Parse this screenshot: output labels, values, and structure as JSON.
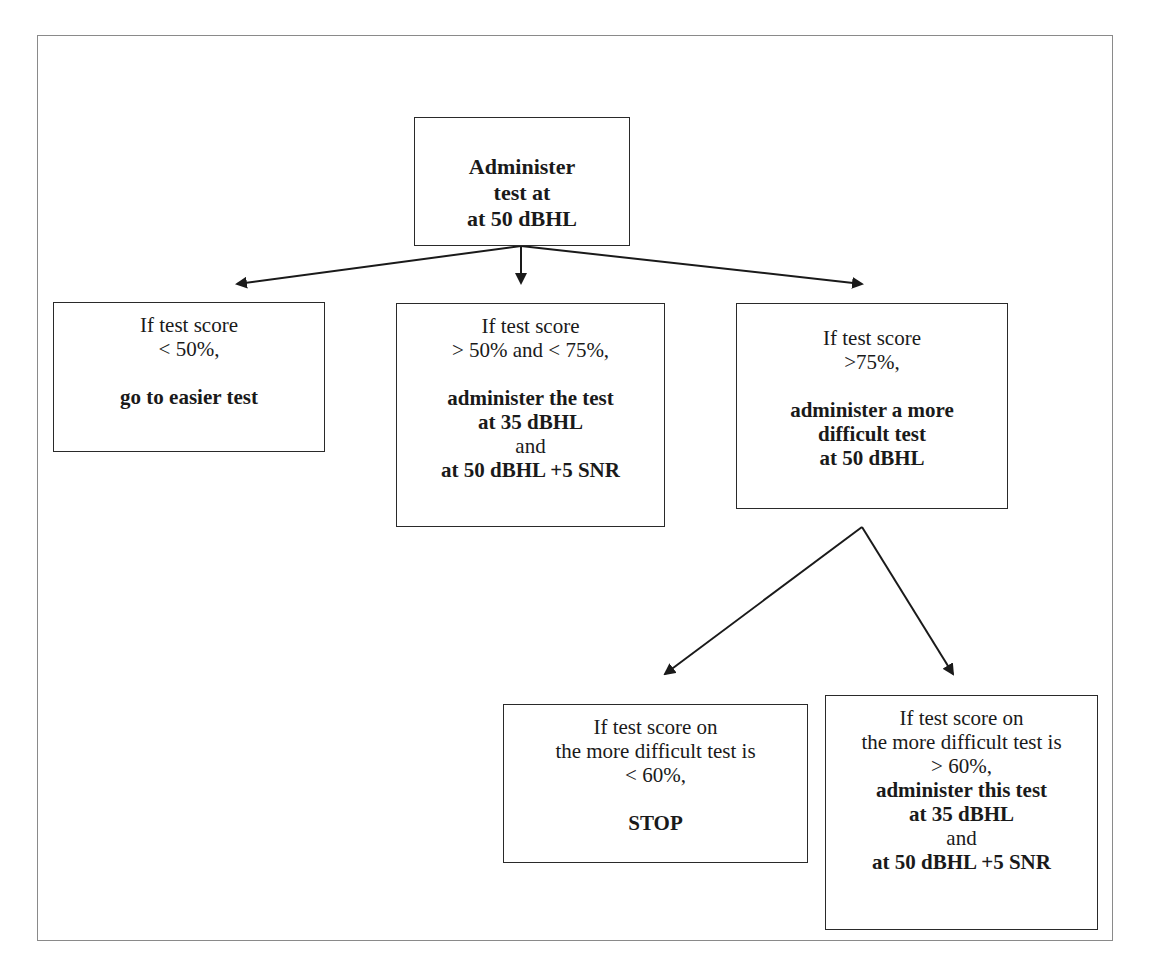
{
  "diagram": {
    "type": "flowchart",
    "nodes": {
      "start": {
        "lines": [
          {
            "text": "Administer",
            "bold": true
          },
          {
            "text": "test at",
            "bold": true
          },
          {
            "text": "at 50 dBHL",
            "bold": true
          }
        ]
      },
      "low": {
        "lines": [
          {
            "text": "If test score",
            "bold": false
          },
          {
            "text": "< 50%,",
            "bold": false
          },
          {
            "text": "",
            "bold": false
          },
          {
            "text": "go to easier test",
            "bold": true
          }
        ]
      },
      "mid": {
        "lines": [
          {
            "text": "If test score",
            "bold": false
          },
          {
            "text": "> 50% and < 75%,",
            "bold": false
          },
          {
            "text": "",
            "bold": false
          },
          {
            "text": "administer the test",
            "bold": true
          },
          {
            "text": "at 35 dBHL",
            "bold": true
          },
          {
            "text": "and",
            "bold": false
          },
          {
            "text": "at 50 dBHL +5 SNR",
            "bold": true
          }
        ]
      },
      "high": {
        "lines": [
          {
            "text": "If test score",
            "bold": false
          },
          {
            "text": ">75%,",
            "bold": false
          },
          {
            "text": "",
            "bold": false
          },
          {
            "text": "administer a more",
            "bold": true
          },
          {
            "text": "difficult test",
            "bold": true
          },
          {
            "text": "at 50 dBHL",
            "bold": true
          }
        ]
      },
      "stop": {
        "lines": [
          {
            "text": "If test score on",
            "bold": false
          },
          {
            "text": "the more difficult test is",
            "bold": false
          },
          {
            "text": "< 60%,",
            "bold": false
          },
          {
            "text": "",
            "bold": false
          },
          {
            "text": "STOP",
            "bold": true
          }
        ]
      },
      "continue": {
        "lines": [
          {
            "text": "If test score on",
            "bold": false
          },
          {
            "text": "the more difficult test is",
            "bold": false
          },
          {
            "text": "> 60%,",
            "bold": false
          },
          {
            "text": "administer this test",
            "bold": true
          },
          {
            "text": "at 35 dBHL",
            "bold": true
          },
          {
            "text": "and",
            "bold": false
          },
          {
            "text": "at 50 dBHL +5 SNR",
            "bold": true
          }
        ]
      }
    },
    "edges": [
      {
        "from": "start",
        "to": "low"
      },
      {
        "from": "start",
        "to": "mid"
      },
      {
        "from": "start",
        "to": "high"
      },
      {
        "from": "high",
        "to": "stop"
      },
      {
        "from": "high",
        "to": "continue"
      }
    ],
    "colors": {
      "frame": "#8a8a8a",
      "box_border": "#2a2a2a",
      "arrow": "#1a1a1a",
      "text": "#1a1a1a"
    }
  }
}
